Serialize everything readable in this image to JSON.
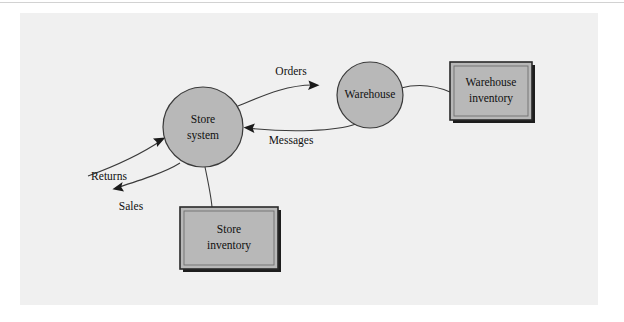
{
  "figure": {
    "background_color": "#ffffff",
    "panel_color": "#f0f0f0",
    "node_fill_color": "#b8b8b8",
    "node_stroke_color": "#3a3a3a",
    "connector_color": "#3a3a3a",
    "text_color": "#101010"
  },
  "nodes": {
    "store_system": {
      "label_line1": "Store",
      "label_line2": "system",
      "shape": "circle",
      "cx": 203,
      "cy": 127,
      "r": 40
    },
    "warehouse": {
      "label_line1": "Warehouse",
      "shape": "circle",
      "cx": 370,
      "cy": 95,
      "r": 33
    },
    "warehouse_inventory": {
      "label_line1": "Warehouse",
      "label_line2": "inventory",
      "shape": "box",
      "x": 450,
      "y": 62,
      "width": 82,
      "height": 58
    },
    "store_inventory": {
      "label_line1": "Store",
      "label_line2": "inventory",
      "shape": "box",
      "x": 180,
      "y": 207,
      "width": 98,
      "height": 62
    }
  },
  "flows": [
    {
      "name": "orders",
      "label": "Orders",
      "label_x": 291,
      "label_y": 72,
      "direction": "store-system-to-warehouse"
    },
    {
      "name": "messages",
      "label": "Messages",
      "label_x": 291,
      "label_y": 141,
      "direction": "warehouse-to-store-system"
    },
    {
      "name": "returns",
      "label": "Returns",
      "label_x": 109,
      "label_y": 177,
      "direction": "into-store-system"
    },
    {
      "name": "sales",
      "label": "Sales",
      "label_x": 131,
      "label_y": 207,
      "direction": "out-of-store-system"
    }
  ],
  "links": [
    {
      "name": "warehouse-to-warehouse-inventory",
      "style": "plain-line"
    },
    {
      "name": "store-system-to-store-inventory",
      "style": "plain-line"
    }
  ]
}
